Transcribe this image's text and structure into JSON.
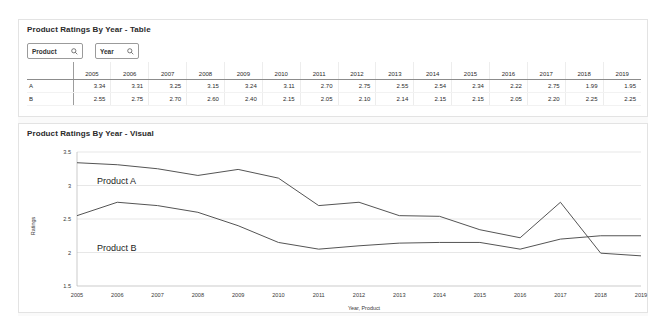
{
  "table_panel": {
    "title": "Product Ratings By Year - Table",
    "filters": [
      {
        "label": "Product",
        "icon": "search-icon"
      },
      {
        "label": "Year",
        "icon": "search-icon"
      }
    ],
    "corner_header": "",
    "columns": [
      "2005",
      "2006",
      "2007",
      "2008",
      "2009",
      "2010",
      "2011",
      "2012",
      "2013",
      "2014",
      "2015",
      "2016",
      "2017",
      "2018",
      "2019"
    ],
    "rows": [
      {
        "label": "A",
        "values": [
          "3.34",
          "3.31",
          "3.25",
          "3.15",
          "3.24",
          "3.11",
          "2.70",
          "2.75",
          "2.55",
          "2.54",
          "2.34",
          "2.22",
          "2.75",
          "1.99",
          "1.95"
        ]
      },
      {
        "label": "B",
        "values": [
          "2.55",
          "2.75",
          "2.70",
          "2.60",
          "2.40",
          "2.15",
          "2.05",
          "2.10",
          "2.14",
          "2.15",
          "2.15",
          "2.05",
          "2.20",
          "2.25",
          "2.25"
        ]
      }
    ]
  },
  "visual_panel": {
    "title": "Product Ratings By Year - Visual"
  },
  "chart_data": {
    "type": "line",
    "title": "Product Ratings By Year - Visual",
    "xlabel": "Year, Product",
    "ylabel": "Ratings",
    "categories": [
      "2005",
      "2006",
      "2007",
      "2008",
      "2009",
      "2010",
      "2011",
      "2012",
      "2013",
      "2014",
      "2015",
      "2016",
      "2017",
      "2018",
      "2019"
    ],
    "ylim": [
      1.5,
      3.5
    ],
    "yticks": [
      "3.5",
      "3",
      "2.5",
      "2",
      "1.5"
    ],
    "grid": true,
    "legend": "inline-labels",
    "series": [
      {
        "name": "Product A",
        "values": [
          3.34,
          3.31,
          3.25,
          3.15,
          3.24,
          3.11,
          2.7,
          2.75,
          2.55,
          2.54,
          2.34,
          2.22,
          2.75,
          1.99,
          1.95
        ],
        "color": "#545454"
      },
      {
        "name": "Product B",
        "values": [
          2.55,
          2.75,
          2.7,
          2.6,
          2.4,
          2.15,
          2.05,
          2.1,
          2.14,
          2.15,
          2.15,
          2.05,
          2.2,
          2.25,
          2.25
        ],
        "color": "#545454"
      }
    ]
  }
}
